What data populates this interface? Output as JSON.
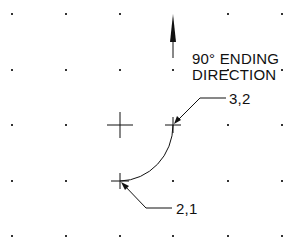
{
  "diagram": {
    "title_line1": "90° ENDING",
    "title_line2": "DIRECTION",
    "start_point_label": "2,1",
    "end_point_label": "3,2",
    "colors": {
      "ink": "#111111",
      "grid_dot": "#333333",
      "background": "#ffffff"
    },
    "grid": {
      "columns_x": [
        12,
        66,
        120,
        173,
        228,
        282
      ],
      "rows_y": [
        14,
        70,
        125,
        181,
        236
      ]
    },
    "center_marker": {
      "x": 120,
      "y": 125
    },
    "arc": {
      "start": {
        "x": 120,
        "y": 181
      },
      "end": {
        "x": 173,
        "y": 125
      },
      "radius": 54
    },
    "direction_arrow": {
      "x": 173,
      "tip_y": 14,
      "tail_y": 58,
      "direction": "up"
    }
  }
}
